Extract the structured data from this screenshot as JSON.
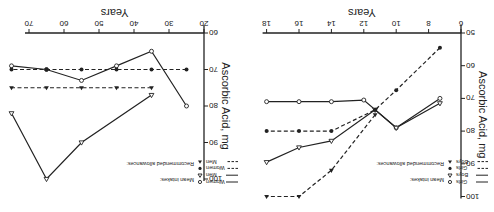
{
  "figure": {
    "orientation_note": "rendered rotated 180 degrees",
    "ink_color": "#222222",
    "background": "#ffffff"
  },
  "legend_left": {
    "title_means": "Mean intakes:",
    "title_allowances": "Recommended allowances:",
    "items": [
      {
        "symbol": "open-circle",
        "label": "Women",
        "line": "solid"
      },
      {
        "symbol": "open-triangle",
        "label": "Men",
        "line": "solid"
      },
      {
        "symbol": "filled-circle",
        "label": "Women",
        "line": "dashed"
      },
      {
        "symbol": "filled-triangle",
        "label": "Men",
        "line": "dashed"
      }
    ]
  },
  "legend_right": {
    "title_means": "Mean intakes:",
    "title_allowances": "Recommended allowances:",
    "items": [
      {
        "symbol": "open-circle",
        "label": "Girls",
        "line": "solid"
      },
      {
        "symbol": "open-triangle",
        "label": "Boys",
        "line": "solid"
      },
      {
        "symbol": "filled-circle",
        "label": "Girls",
        "line": "dashed"
      },
      {
        "symbol": "filled-triangle",
        "label": "Boys",
        "line": "dashed"
      }
    ]
  },
  "chart_data": [
    {
      "type": "line",
      "title": "",
      "xlabel": "Years",
      "ylabel": "Ascorbic Acid, mg",
      "xlim": [
        20,
        75
      ],
      "ylim": [
        60,
        100
      ],
      "xticks": [
        20,
        30,
        40,
        50,
        60,
        70
      ],
      "yticks": [
        60,
        70,
        80,
        90,
        100
      ],
      "grid": false,
      "series": [
        {
          "name": "Mean intakes: Women",
          "marker": "open-circle",
          "line": "solid",
          "x": [
            25,
            35,
            45,
            55,
            65,
            75
          ],
          "y": [
            80,
            65,
            69,
            73,
            70,
            69
          ]
        },
        {
          "name": "Mean intakes: Men",
          "marker": "open-triangle",
          "line": "solid",
          "x": [
            35,
            55,
            65,
            75
          ],
          "y": [
            77,
            90,
            100,
            82
          ]
        },
        {
          "name": "Recommended allowances: Women",
          "marker": "filled-circle",
          "line": "dashed",
          "x": [
            25,
            35,
            45,
            55,
            65,
            75
          ],
          "y": [
            70,
            70,
            70,
            70,
            70,
            70
          ]
        },
        {
          "name": "Recommended allowances: Men",
          "marker": "filled-triangle",
          "line": "dashed",
          "x": [
            35,
            45,
            55,
            65,
            75
          ],
          "y": [
            75,
            75,
            75,
            75,
            75
          ]
        }
      ]
    },
    {
      "type": "line",
      "title": "",
      "xlabel": "Years",
      "ylabel": "Ascorbic Acid, mg",
      "xlim": [
        6,
        18
      ],
      "ylim": [
        50,
        100
      ],
      "xticks": [
        6,
        8,
        10,
        12,
        14,
        16,
        18
      ],
      "yticks": [
        50,
        60,
        70,
        80,
        90,
        100
      ],
      "grid": false,
      "series": [
        {
          "name": "Mean intakes: Girls",
          "marker": "open-circle",
          "line": "solid",
          "x": [
            7.3,
            10,
            12,
            14,
            16,
            18
          ],
          "y": [
            70,
            79,
            70.5,
            71,
            71,
            71
          ]
        },
        {
          "name": "Mean intakes: Boys",
          "marker": "open-triangle",
          "line": "solid",
          "x": [
            7.3,
            10,
            11.3,
            14,
            16,
            18
          ],
          "y": [
            71.5,
            79,
            73.5,
            83,
            85,
            89.5
          ]
        },
        {
          "name": "Recommended allowances: Girls",
          "marker": "filled-circle",
          "line": "dashed",
          "x": [
            7.3,
            10,
            11.3,
            14,
            16,
            18
          ],
          "y": [
            54.5,
            67.5,
            73.5,
            80,
            80,
            80
          ]
        },
        {
          "name": "Recommended allowances: Boys",
          "marker": "filled-triangle",
          "line": "dashed",
          "x": [
            11.3,
            14,
            16,
            18
          ],
          "y": [
            75,
            92,
            100,
            100
          ]
        }
      ]
    }
  ]
}
